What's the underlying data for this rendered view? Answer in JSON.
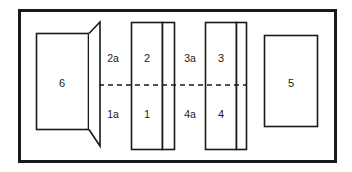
{
  "figure": {
    "kind": "technical-line-diagram",
    "width": 352,
    "height": 172,
    "background": "#ffffff",
    "stroke_color": "#1a1a1a",
    "fill_color": "#ffffff",
    "outer_border": {
      "label": "enclosure-outline",
      "x": 18,
      "y": 9,
      "width": 319,
      "height": 154,
      "stroke_width": 3
    },
    "axis": {
      "label": "optical-axis",
      "style": "dashed",
      "x1": 99,
      "x2": 247,
      "y": 85,
      "dash": "5,4",
      "stroke_width": 1.6
    },
    "components": [
      {
        "id": "horn",
        "name": "flared-horn-assembly",
        "body": {
          "x": 36,
          "y": 33,
          "width": 53,
          "height": 97
        },
        "flare": {
          "inner_top_x": 89,
          "inner_top_y": 33,
          "inner_bottom_x": 89,
          "inner_bottom_y": 130,
          "outer_top_x": 100,
          "outer_top_y": 22,
          "outer_bottom_x": 100,
          "outer_bottom_y": 146
        },
        "label": "6",
        "label_x": 62,
        "label_y": 83
      },
      {
        "id": "group-a",
        "name": "element-group-a",
        "main": {
          "x": 131,
          "y": 22,
          "width": 32,
          "height": 128
        },
        "plate": {
          "x": 163,
          "y": 22,
          "width": 12,
          "height": 128
        },
        "labels": {
          "top": "2",
          "bottom": "1",
          "top_x": 147,
          "top_y": 58,
          "bottom_x": 147,
          "bottom_y": 114
        }
      },
      {
        "id": "group-b",
        "name": "element-group-b",
        "main": {
          "x": 205,
          "y": 22,
          "width": 32,
          "height": 128
        },
        "plate": {
          "x": 237,
          "y": 22,
          "width": 10,
          "height": 128
        },
        "labels": {
          "top": "3",
          "bottom": "4",
          "top_x": 221,
          "top_y": 58,
          "bottom_x": 221,
          "bottom_y": 114
        }
      },
      {
        "id": "block-5",
        "name": "detector-block",
        "body": {
          "x": 264,
          "y": 35,
          "width": 54,
          "height": 92
        },
        "label": "5",
        "label_x": 291,
        "label_y": 83
      }
    ],
    "callouts": [
      {
        "id": "callout-2a",
        "text": "2a",
        "x": 113,
        "y": 58
      },
      {
        "id": "callout-1a",
        "text": "1a",
        "x": 113,
        "y": 114
      },
      {
        "id": "callout-3a",
        "text": "3a",
        "x": 190,
        "y": 58
      },
      {
        "id": "callout-4a",
        "text": "4a",
        "x": 190,
        "y": 114
      }
    ]
  }
}
